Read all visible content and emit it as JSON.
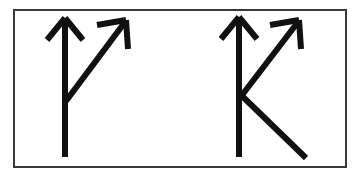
{
  "figure": {
    "description": "A thin black rectangular frame on a white background containing two black hand-drawn arrow symbols. The left symbol is a vertical up-arrow with a diagonal up-right arrow branching from the middle of its stem. The right symbol adds a third stroke descending down-right from the same junction, forming a K-like shape.",
    "background_color": "#fdfdfd",
    "panel_color": "#ffffff",
    "ink_color": "#111111",
    "frame_color": "#3a3a3a",
    "frame_width_px": 2,
    "glyph_count": "2"
  },
  "frame": {
    "name": "outer-rectangle-border",
    "x": 14,
    "y": 10,
    "width": 332,
    "height": 157
  },
  "glyphs": [
    {
      "id": "glyph-left",
      "label": "Left glyph",
      "shape_name": "vertical-arrow-with-branching-diagonal-arrow",
      "stroke_width": 6,
      "strokes": [
        {
          "name": "vertical-shaft",
          "type": "line",
          "points": [
            [
              65,
              20
            ],
            [
              65,
              157
            ]
          ]
        },
        {
          "name": "vertical-arrowhead-left-barb",
          "type": "line",
          "points": [
            [
              65,
              18
            ],
            [
              47,
              40
            ]
          ]
        },
        {
          "name": "vertical-arrowhead-right-barb",
          "type": "line",
          "points": [
            [
              65,
              18
            ],
            [
              83,
              40
            ]
          ]
        },
        {
          "name": "diagonal-shaft",
          "type": "line",
          "points": [
            [
              66,
              101
            ],
            [
              125,
              22
            ]
          ]
        },
        {
          "name": "diagonal-arrowhead-left-barb",
          "type": "line",
          "points": [
            [
              126,
              20
            ],
            [
              97,
              25
            ]
          ]
        },
        {
          "name": "diagonal-arrowhead-right-barb",
          "type": "line",
          "points": [
            [
              126,
              20
            ],
            [
              128,
              49
            ]
          ]
        }
      ],
      "junction_point": [
        66,
        101
      ],
      "vertical_tip": [
        65,
        18
      ],
      "diagonal_tip": [
        126,
        20
      ],
      "shaft_bottom": [
        65,
        157
      ]
    },
    {
      "id": "glyph-right",
      "label": "Right glyph",
      "shape_name": "vertical-arrow-with-diagonal-arrow-and-descending-leg",
      "stroke_width": 6,
      "strokes": [
        {
          "name": "vertical-shaft",
          "type": "line",
          "points": [
            [
              239,
              19
            ],
            [
              239,
              157
            ]
          ]
        },
        {
          "name": "vertical-arrowhead-left-barb",
          "type": "line",
          "points": [
            [
              239,
              17
            ],
            [
              221,
              39
            ]
          ]
        },
        {
          "name": "vertical-arrowhead-right-barb",
          "type": "line",
          "points": [
            [
              239,
              17
            ],
            [
              257,
              39
            ]
          ]
        },
        {
          "name": "diagonal-shaft",
          "type": "line",
          "points": [
            [
              239,
              99
            ],
            [
              298,
              22
            ]
          ]
        },
        {
          "name": "diagonal-arrowhead-left-barb",
          "type": "line",
          "points": [
            [
              299,
              20
            ],
            [
              270,
              25
            ]
          ]
        },
        {
          "name": "diagonal-arrowhead-right-barb",
          "type": "line",
          "points": [
            [
              299,
              20
            ],
            [
              301,
              49
            ]
          ]
        },
        {
          "name": "descending-leg",
          "type": "line",
          "points": [
            [
              241,
              95
            ],
            [
              306,
              158
            ]
          ]
        }
      ],
      "junction_point": [
        239,
        97
      ],
      "vertical_tip": [
        239,
        17
      ],
      "diagonal_tip": [
        299,
        20
      ],
      "shaft_bottom": [
        239,
        157
      ],
      "leg_bottom": [
        306,
        158
      ]
    }
  ]
}
